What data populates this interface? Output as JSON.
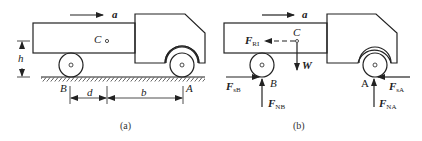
{
  "figure_a": {
    "caption": "(a)",
    "accel_label": "a",
    "center_label": "C",
    "height_label": "h",
    "rear_contact_label": "B",
    "front_contact_label": "A",
    "dim_d_label": "d",
    "dim_b_label": "b"
  },
  "figure_b": {
    "caption": "(b)",
    "accel_label": "a",
    "center_label": "C",
    "weight_label": "W",
    "inertia_force": {
      "main": "F",
      "sub": "RI"
    },
    "friction_B": {
      "main": "F",
      "sub": "sB"
    },
    "normal_B": {
      "main": "F",
      "sub": "NB"
    },
    "friction_A": {
      "main": "F",
      "sub": "sA"
    },
    "normal_A": {
      "main": "F",
      "sub": "NA"
    },
    "rear_contact_label": "B",
    "front_contact_label": "A"
  }
}
